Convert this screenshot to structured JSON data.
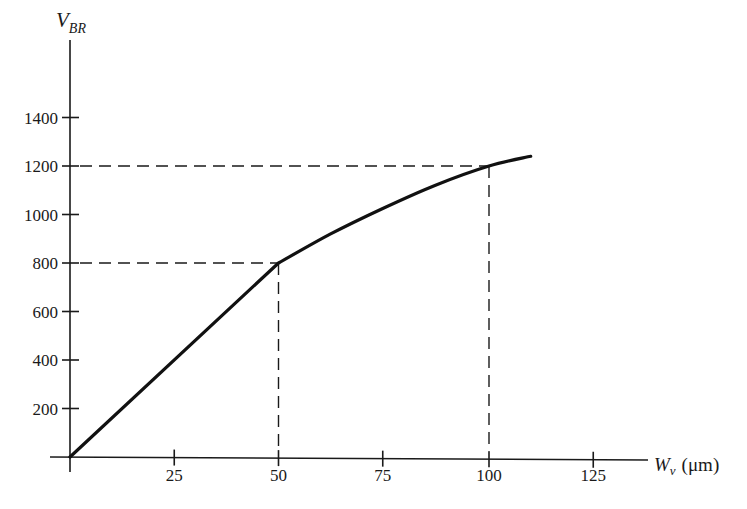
{
  "chart_data": {
    "type": "line",
    "title": "",
    "xlabel": "W_ν (μm)",
    "ylabel": "V_BR",
    "xlabel_parts": {
      "main": "W",
      "sub": "ν",
      "unit": "(μm)"
    },
    "ylabel_parts": {
      "main": "V",
      "sub": "BR"
    },
    "xlim": [
      0,
      140
    ],
    "ylim": [
      0,
      1400
    ],
    "x_ticks": [
      25,
      50,
      75,
      100,
      125
    ],
    "y_ticks": [
      200,
      400,
      600,
      800,
      1000,
      1200,
      1400
    ],
    "grid": false,
    "legend": null,
    "series": [
      {
        "name": "V_BR vs W_ν",
        "x": [
          0,
          50,
          62.5,
          75,
          87.5,
          100,
          110
        ],
        "y": [
          0,
          800,
          920,
          1025,
          1120,
          1200,
          1240
        ]
      }
    ],
    "annotations": [
      {
        "type": "dashed-guide",
        "x": 50,
        "y": 800
      },
      {
        "type": "dashed-guide",
        "x": 100,
        "y": 1200
      }
    ]
  }
}
